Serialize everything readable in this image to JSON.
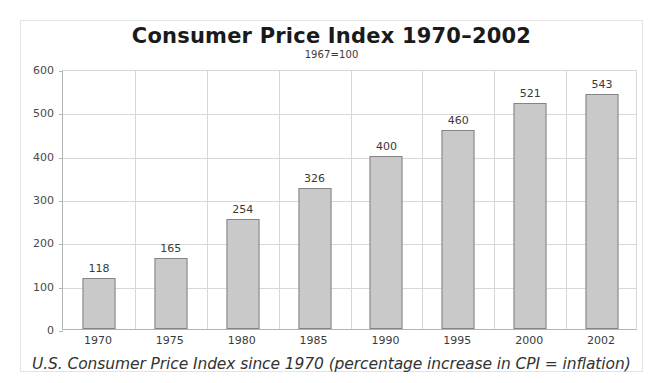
{
  "chart_data": {
    "type": "bar",
    "title": "Consumer Price Index 1970–2002",
    "subtitle": "1967=100",
    "caption": "U.S. Consumer Price Index since 1970 (percentage increase in CPI = inflation)",
    "xlabel": "",
    "ylabel": "",
    "categories": [
      "1970",
      "1975",
      "1980",
      "1985",
      "1990",
      "1995",
      "2000",
      "2002"
    ],
    "values": [
      118,
      165,
      254,
      326,
      400,
      460,
      521,
      543
    ],
    "value_labels": [
      "118",
      "165",
      "254",
      "326",
      "400",
      "460",
      "521",
      "543"
    ],
    "ylim": [
      0,
      600
    ],
    "yticks": [
      0,
      100,
      200,
      300,
      400,
      500,
      600
    ],
    "ytick_labels": [
      "0",
      "100",
      "200",
      "300",
      "400",
      "500",
      "600"
    ],
    "grid": true,
    "legend": null,
    "colors": {
      "bar_fill": "#c9c9c9",
      "bar_stroke": "#848484",
      "gridline": "#d8d8d8",
      "axis": "#b3b3b3",
      "text": "#3a3a3a",
      "title": "#1a1a1a",
      "frame": "#e3e3e3",
      "background": "#ffffff"
    }
  }
}
